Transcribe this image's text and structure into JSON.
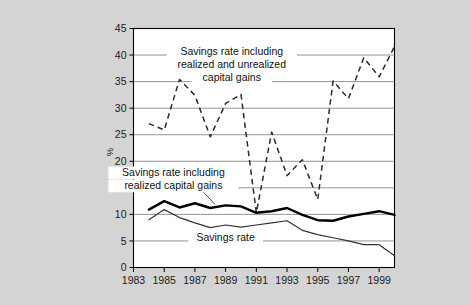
{
  "chart_data": {
    "type": "line",
    "title": "",
    "subtitle": "",
    "xlabel": "",
    "ylabel": "%",
    "xlim": [
      1983,
      2000
    ],
    "ylim": [
      0,
      45
    ],
    "ytick_labels": [
      "0",
      "5",
      "10",
      "15",
      "20",
      "25",
      "30",
      "35",
      "40",
      "45"
    ],
    "ytick_values": [
      0,
      5,
      10,
      15,
      20,
      25,
      30,
      35,
      40,
      45
    ],
    "xtick_labels": [
      "1983",
      "1985",
      "1987",
      "1989",
      "1991",
      "1993",
      "1995",
      "1997",
      "1999"
    ],
    "xtick_values": [
      1983,
      1985,
      1987,
      1989,
      1991,
      1993,
      1995,
      1997,
      1999
    ],
    "grid": "horizontal",
    "legend_position": "inline-annotations",
    "x": [
      1984,
      1985,
      1986,
      1987,
      1988,
      1989,
      1990,
      1991,
      1992,
      1993,
      1994,
      1995,
      1996,
      1997,
      1998,
      1999,
      2000
    ],
    "series": [
      {
        "name": "Savings rate including realized and unrealized capital gains",
        "style": "dashed",
        "color": "#2b2b2b",
        "values": [
          27.1,
          25.9,
          35.4,
          32.4,
          24.6,
          30.9,
          32.6,
          10.3,
          25.5,
          17.3,
          20.3,
          12.8,
          35.1,
          31.8,
          39.5,
          35.9,
          41.6
        ]
      },
      {
        "name": "Savings rate including realized capital gains",
        "style": "solid-thick",
        "color": "#000000",
        "values": [
          10.9,
          12.5,
          11.3,
          12.1,
          11.2,
          11.7,
          11.5,
          10.3,
          10.6,
          11.2,
          9.9,
          8.9,
          8.8,
          9.6,
          10.1,
          10.6,
          9.9
        ]
      },
      {
        "name": "Savings rate",
        "style": "solid-thin",
        "color": "#333333",
        "values": [
          9.0,
          10.9,
          9.4,
          8.4,
          7.5,
          8.0,
          7.6,
          8.0,
          8.4,
          8.8,
          7.0,
          6.2,
          5.6,
          5.0,
          4.3,
          4.3,
          2.2
        ]
      }
    ],
    "annotations": [
      {
        "name": "annotation-unrealized",
        "lines": [
          "Savings rate including",
          "realized and unrealized",
          "capital gains"
        ],
        "x": 1989.4,
        "y": 40.0
      },
      {
        "name": "annotation-realized",
        "lines": [
          "Savings rate including",
          "realized capital gains"
        ],
        "x": 1985.6,
        "y": 17.2
      },
      {
        "name": "annotation-savings-rate",
        "lines": [
          "Savings rate"
        ],
        "x": 1989.0,
        "y": 5.0
      }
    ]
  },
  "colors": {
    "page_background": "#d4d4d4",
    "plot_background": "#ffffff",
    "axis": "#000000",
    "gridline": "#7a7a7a"
  }
}
